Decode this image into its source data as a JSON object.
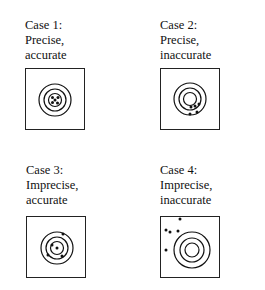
{
  "cases": [
    {
      "id": 1,
      "heading": "Case 1:",
      "precision": "Precise,",
      "accuracy": "accurate",
      "label_pos": [
        25,
        18
      ],
      "box_pos": [
        25,
        68
      ],
      "rings_center": [
        29,
        31
      ],
      "rings_r": [
        16,
        11,
        6.5
      ],
      "hits": [
        [
          29,
          31
        ],
        [
          26.5,
          28.5
        ],
        [
          32,
          28.5
        ],
        [
          26.5,
          33.5
        ],
        [
          31.5,
          34
        ]
      ]
    },
    {
      "id": 2,
      "heading": "Case 2:",
      "precision": "Precise,",
      "accuracy": "inaccurate",
      "label_pos": [
        160,
        18
      ],
      "box_pos": [
        160,
        68
      ],
      "rings_center": [
        29,
        30
      ],
      "rings_r": [
        16,
        11,
        6.5
      ],
      "hits": [
        [
          30,
          38
        ],
        [
          34,
          37
        ],
        [
          38,
          35
        ],
        [
          29,
          45
        ],
        [
          36,
          43
        ]
      ]
    },
    {
      "id": 3,
      "heading": "Case 3:",
      "precision": "Imprecise,",
      "accuracy": "accurate",
      "label_pos": [
        26,
        163
      ],
      "box_pos": [
        26,
        216
      ],
      "rings_center": [
        30,
        31
      ],
      "rings_r": [
        16,
        11,
        6.5
      ],
      "hits": [
        [
          30,
          31
        ],
        [
          36,
          17
        ],
        [
          25,
          28
        ],
        [
          21,
          38
        ],
        [
          35,
          39
        ]
      ]
    },
    {
      "id": 4,
      "heading": "Case 4:",
      "precision": "Imprecise,",
      "accuracy": "inaccurate",
      "label_pos": [
        160,
        163
      ],
      "box_pos": [
        160,
        216
      ],
      "rings_center": [
        31,
        33
      ],
      "rings_r": [
        18,
        12,
        7
      ],
      "hits": [
        [
          19,
          2
        ],
        [
          5,
          13
        ],
        [
          9,
          15
        ],
        [
          17,
          14
        ],
        [
          5,
          33
        ]
      ]
    }
  ],
  "colors": {
    "ink": "#111111",
    "background": "#ffffff"
  }
}
